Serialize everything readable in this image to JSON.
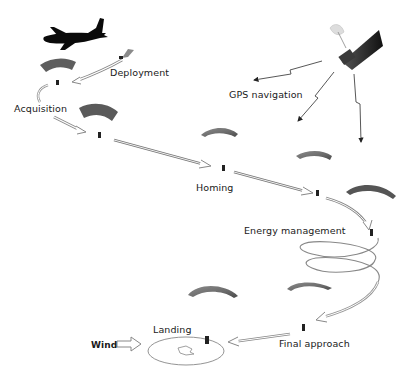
{
  "diagram": {
    "type": "flow",
    "colors": {
      "canopy_dark": "#5a5a5a",
      "canopy_mid": "#7c7c7c",
      "aircraft": "#0a0a0a",
      "arrow_stroke": "#7a7a7a",
      "text": "#1a1a1a"
    },
    "nodes": [
      {
        "id": "aircraft",
        "label": "",
        "icon": "cargo-aircraft-icon"
      },
      {
        "id": "satellite",
        "label": "",
        "icon": "gps-satellite-icon"
      },
      {
        "id": "deployment",
        "label": "Deployment"
      },
      {
        "id": "acquisition",
        "label": "Acquisition"
      },
      {
        "id": "gps",
        "label": "GPS navigation"
      },
      {
        "id": "homing",
        "label": "Homing"
      },
      {
        "id": "energy",
        "label": "Energy management"
      },
      {
        "id": "final",
        "label": "Final approach"
      },
      {
        "id": "landing",
        "label": "Landing"
      },
      {
        "id": "wind",
        "label": "Wind"
      }
    ],
    "edges": [
      {
        "from": "aircraft",
        "to": "deployment"
      },
      {
        "from": "deployment",
        "to": "acquisition"
      },
      {
        "from": "acquisition",
        "to": "homing"
      },
      {
        "from": "homing",
        "to": "energy"
      },
      {
        "from": "energy",
        "to": "final"
      },
      {
        "from": "final",
        "to": "landing"
      },
      {
        "from": "satellite",
        "to": "gps",
        "style": "lightning"
      },
      {
        "from": "wind",
        "to": "landing"
      }
    ]
  },
  "labels": {
    "deployment": "Deployment",
    "acquisition": "Acquisition",
    "gps": "GPS navigation",
    "homing": "Homing",
    "energy": "Energy management",
    "final": "Final approach",
    "landing": "Landing",
    "wind": "Wind"
  }
}
